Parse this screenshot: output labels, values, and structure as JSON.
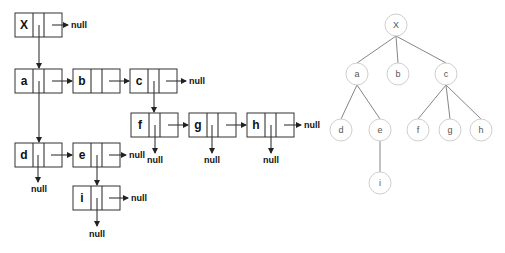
{
  "null_label": "null",
  "linked_nodes": [
    {
      "id": "X",
      "x": 15,
      "y": 13
    },
    {
      "id": "a",
      "x": 15,
      "y": 69
    },
    {
      "id": "b",
      "x": 73,
      "y": 69
    },
    {
      "id": "c",
      "x": 130,
      "y": 69
    },
    {
      "id": "f",
      "x": 131,
      "y": 113
    },
    {
      "id": "g",
      "x": 189,
      "y": 113
    },
    {
      "id": "h",
      "x": 247,
      "y": 113
    },
    {
      "id": "d",
      "x": 15,
      "y": 143
    },
    {
      "id": "e",
      "x": 73,
      "y": 143
    },
    {
      "id": "i",
      "x": 73,
      "y": 186
    }
  ],
  "tree_nodes": [
    {
      "id": "X",
      "cx": 396,
      "cy": 25
    },
    {
      "id": "a",
      "cx": 357,
      "cy": 74
    },
    {
      "id": "b",
      "cx": 398,
      "cy": 74
    },
    {
      "id": "c",
      "cx": 446,
      "cy": 74
    },
    {
      "id": "d",
      "cx": 341,
      "cy": 130
    },
    {
      "id": "e",
      "cx": 380,
      "cy": 130
    },
    {
      "id": "f",
      "cx": 418,
      "cy": 130
    },
    {
      "id": "g",
      "cx": 450,
      "cy": 130
    },
    {
      "id": "h",
      "cx": 481,
      "cy": 130
    },
    {
      "id": "i",
      "cx": 380,
      "cy": 183
    }
  ],
  "tree_edges": [
    [
      "X",
      "a"
    ],
    [
      "X",
      "b"
    ],
    [
      "X",
      "c"
    ],
    [
      "a",
      "d"
    ],
    [
      "a",
      "e"
    ],
    [
      "e",
      "i"
    ],
    [
      "c",
      "f"
    ],
    [
      "c",
      "g"
    ],
    [
      "c",
      "h"
    ]
  ]
}
